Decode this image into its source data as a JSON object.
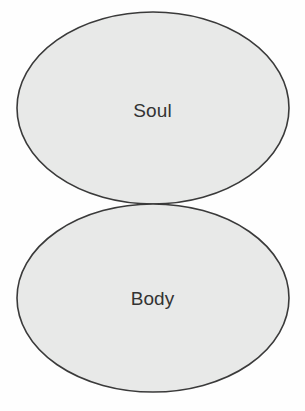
{
  "diagram": {
    "type": "two-tangent-ellipses",
    "background_color": "#fefefe",
    "shapes": [
      {
        "id": "soul",
        "label": "Soul",
        "shape": "ellipse",
        "cx": 153,
        "cy": 108,
        "rx": 136,
        "ry": 96,
        "fill": "#e8e9e8",
        "stroke": "#3a3a3a",
        "stroke_width": 1.6,
        "label_color": "#333333",
        "label_x": 151,
        "label_y": 110
      },
      {
        "id": "body",
        "label": "Body",
        "shape": "ellipse",
        "cx": 153,
        "cy": 298,
        "rx": 136,
        "ry": 94,
        "fill": "#e8e9e8",
        "stroke": "#3a3a3a",
        "stroke_width": 1.6,
        "label_color": "#333333",
        "label_x": 151,
        "label_y": 298
      }
    ]
  }
}
